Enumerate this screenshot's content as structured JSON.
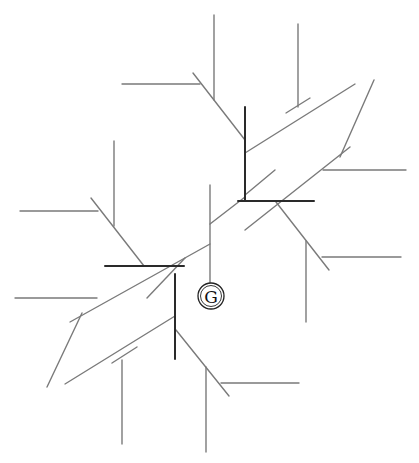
{
  "diagram": {
    "title": "",
    "center_node": {
      "label": "G",
      "cx": 211,
      "cy": 296,
      "r": 13
    },
    "top_text_cropped": "",
    "colors": {
      "line_thin": "#7a7a7a",
      "line_bold": "#2a2a2a",
      "background": "#ffffff"
    },
    "segments": {
      "thin": [
        [
          214,
          15,
          214,
          100
        ],
        [
          298,
          24,
          298,
          107
        ],
        [
          122,
          84,
          200,
          84
        ],
        [
          193,
          73,
          245,
          140
        ],
        [
          310,
          98,
          286,
          113
        ],
        [
          355,
          84,
          245,
          153
        ],
        [
          374,
          80,
          340,
          157
        ],
        [
          350,
          147,
          245,
          230
        ],
        [
          323,
          170,
          406,
          170
        ],
        [
          245,
          195,
          275,
          170
        ],
        [
          210,
          185,
          210,
          283
        ],
        [
          210,
          224,
          245,
          197
        ],
        [
          276,
          202,
          329,
          270
        ],
        [
          306,
          241,
          306,
          322
        ],
        [
          322,
          257,
          401,
          257
        ],
        [
          114,
          141,
          114,
          226
        ],
        [
          20,
          211,
          98,
          211
        ],
        [
          91,
          198,
          144,
          266
        ],
        [
          210,
          244,
          70,
          322
        ],
        [
          15,
          298,
          97,
          298
        ],
        [
          82,
          313,
          47,
          387
        ],
        [
          185,
          258,
          147,
          298
        ],
        [
          175,
          316,
          65,
          384
        ],
        [
          137,
          347,
          112,
          363
        ],
        [
          122,
          360,
          122,
          444
        ],
        [
          176,
          330,
          229,
          396
        ],
        [
          206,
          367,
          206,
          452
        ],
        [
          221,
          383,
          299,
          383
        ]
      ],
      "bold": [
        [
          245,
          107,
          245,
          200
        ],
        [
          238,
          201,
          314,
          201
        ],
        [
          105,
          266,
          184,
          266
        ],
        [
          175,
          274,
          175,
          359
        ]
      ]
    }
  }
}
